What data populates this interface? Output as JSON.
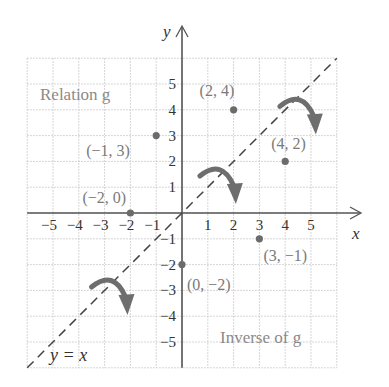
{
  "chart_data": {
    "type": "scatter",
    "title": "",
    "xlabel": "x",
    "ylabel": "y",
    "xlim": [
      -6,
      6
    ],
    "ylim": [
      -6,
      6
    ],
    "grid": true,
    "x_ticks": [
      "−5",
      "−4",
      "−3",
      "−2",
      "−1",
      "1",
      "2",
      "3",
      "4",
      "5"
    ],
    "y_ticks": [
      "5",
      "4",
      "3",
      "2",
      "1",
      "−1",
      "−2",
      "−3",
      "−4",
      "−5"
    ],
    "series": [
      {
        "name": "Relation g",
        "points": [
          [
            2,
            4
          ],
          [
            -1,
            3
          ],
          [
            -2,
            0
          ]
        ],
        "labels": [
          "(2, 4)",
          "(−1, 3)",
          "(−2, 0)"
        ]
      },
      {
        "name": "Inverse of g",
        "points": [
          [
            4,
            2
          ],
          [
            3,
            -1
          ],
          [
            0,
            -2
          ]
        ],
        "labels": [
          "(4, 2)",
          "(3, −1)",
          "(0, −2)"
        ]
      }
    ],
    "reference_line": {
      "equation": "y = x",
      "style": "dashed"
    },
    "annotations": [
      "Relation g",
      "Inverse of g",
      "y = x"
    ],
    "reflection_arrows": 3
  },
  "labels": {
    "relation": "Relation g",
    "inverse": "Inverse of g",
    "line": "y = x",
    "x_axis": "x",
    "y_axis": "y"
  },
  "colors": {
    "point": "#6b6b6b",
    "axis": "#555555",
    "grid": "#c8c8c8",
    "arrow": "#6e6e6e",
    "dash": "#444444"
  }
}
